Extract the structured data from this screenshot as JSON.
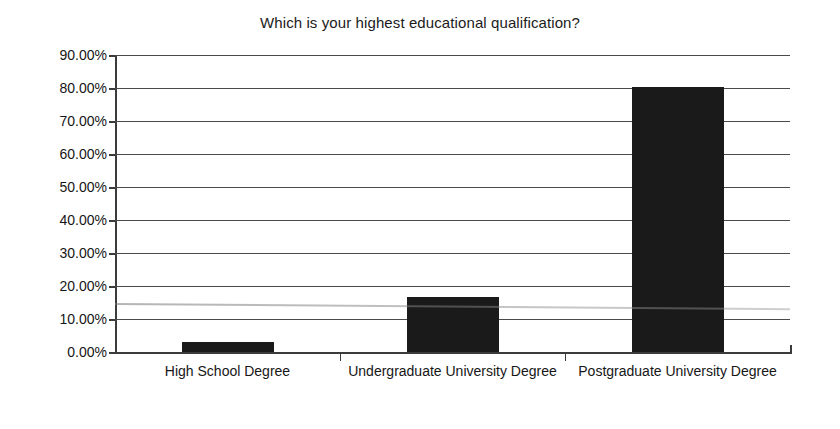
{
  "chart_data": {
    "type": "bar",
    "title": "Which is your highest educational qualification?",
    "xlabel": "",
    "ylabel": "",
    "categories": [
      "High School Degree",
      "Undergraduate University Degree",
      "Postgraduate University Degree"
    ],
    "values": [
      3.0,
      16.7,
      80.3
    ],
    "value_labels": [
      "3.00%",
      "16.70%",
      "80.30%"
    ],
    "ylim": [
      0,
      90
    ],
    "ytick_values": [
      0,
      10,
      20,
      30,
      40,
      50,
      60,
      70,
      80,
      90
    ],
    "ytick_labels": [
      "0.00%",
      "10.00%",
      "20.00%",
      "30.00%",
      "40.00%",
      "50.00%",
      "60.00%",
      "70.00%",
      "80.00%",
      "90.00%"
    ],
    "grid": true,
    "legend": false,
    "legend_position": "none",
    "series": [
      {
        "name": "Respondents",
        "values": [
          3.0,
          16.7,
          80.3
        ]
      }
    ],
    "colors": {
      "bar": "#1a1a1a",
      "gridline": "#4a4a4a",
      "axis": "#3b3b3b",
      "background": "#ffffff",
      "text": "#161616"
    }
  }
}
